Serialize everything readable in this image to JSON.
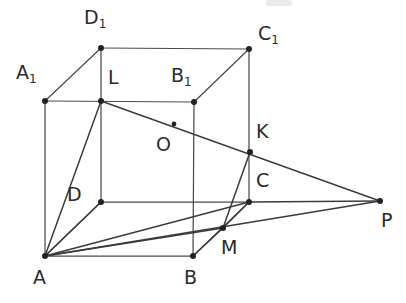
{
  "figure": {
    "width": 406,
    "height": 303,
    "background_color": "#ffffff",
    "line_color": "#3b3b3b",
    "vertex_color": "#222222",
    "label_color": "#2b2b2b"
  },
  "points": [
    {
      "id": "D1",
      "label": "D",
      "sub": "1",
      "x": 101,
      "y": 48,
      "label_x": 84,
      "label_y": 8,
      "dot": true
    },
    {
      "id": "C1",
      "label": "C",
      "sub": "1",
      "x": 249,
      "y": 49,
      "label_x": 258,
      "label_y": 24,
      "dot": true
    },
    {
      "id": "A1",
      "label": "A",
      "sub": "1",
      "x": 45,
      "y": 101,
      "label_x": 16,
      "label_y": 63,
      "dot": true
    },
    {
      "id": "B1",
      "label": "B",
      "sub": "1",
      "x": 194,
      "y": 102,
      "label_x": 171,
      "label_y": 66,
      "dot": true
    },
    {
      "id": "L",
      "label": "L",
      "sub": "",
      "x": 101,
      "y": 101,
      "label_x": 108,
      "label_y": 68,
      "dot": true
    },
    {
      "id": "O",
      "label": "O",
      "sub": "",
      "x": 174,
      "y": 124,
      "label_x": 156,
      "label_y": 135,
      "dot": true
    },
    {
      "id": "K",
      "label": "K",
      "sub": "",
      "x": 250,
      "y": 152,
      "label_x": 256,
      "label_y": 122,
      "dot": true
    },
    {
      "id": "D",
      "label": "D",
      "sub": "",
      "x": 101,
      "y": 202,
      "label_x": 67,
      "label_y": 185,
      "dot": true
    },
    {
      "id": "C",
      "label": "C",
      "sub": "",
      "x": 249,
      "y": 202,
      "label_x": 256,
      "label_y": 171,
      "dot": true
    },
    {
      "id": "P",
      "label": "P",
      "sub": "",
      "x": 380,
      "y": 201,
      "label_x": 381,
      "label_y": 211,
      "dot": true
    },
    {
      "id": "M",
      "label": "M",
      "sub": "",
      "x": 223,
      "y": 228,
      "label_x": 221,
      "label_y": 238,
      "dot": true
    },
    {
      "id": "A",
      "label": "A",
      "sub": "",
      "x": 45,
      "y": 256,
      "label_x": 33,
      "label_y": 268,
      "dot": true
    },
    {
      "id": "B",
      "label": "B",
      "sub": "",
      "x": 193,
      "y": 256,
      "label_x": 184,
      "label_y": 268,
      "dot": true
    }
  ],
  "segments": [
    {
      "name": "edge-D1-C1",
      "from": "D1",
      "to": "C1",
      "style": "thin"
    },
    {
      "name": "edge-D1-A1",
      "from": "D1",
      "to": "A1",
      "style": "thin"
    },
    {
      "name": "edge-D1-D",
      "from": "D1",
      "to": "D",
      "style": "thin"
    },
    {
      "name": "edge-C1-B1",
      "from": "C1",
      "to": "B1",
      "style": "thin"
    },
    {
      "name": "edge-C1-C",
      "from": "C1",
      "to": "C",
      "style": "thin"
    },
    {
      "name": "edge-A1-B1",
      "from": "A1",
      "to": "B1",
      "style": "thin"
    },
    {
      "name": "edge-A1-A",
      "from": "A1",
      "to": "A",
      "style": "thin"
    },
    {
      "name": "edge-B1-B",
      "from": "B1",
      "to": "B",
      "style": "thin"
    },
    {
      "name": "edge-D-C",
      "from": "D",
      "to": "C",
      "style": "thin"
    },
    {
      "name": "edge-D-A",
      "from": "D",
      "to": "A",
      "style": "thin"
    },
    {
      "name": "edge-A-B",
      "from": "A",
      "to": "B",
      "style": "thin"
    },
    {
      "name": "edge-B-C",
      "from": "B",
      "to": "C",
      "style": "thin"
    },
    {
      "name": "line-L-P",
      "from": "L",
      "to": "P",
      "style": "thick"
    },
    {
      "name": "line-A-P",
      "from": "A",
      "to": "P",
      "style": "thick"
    },
    {
      "name": "line-A-L",
      "from": "A",
      "to": "L",
      "style": "thick"
    },
    {
      "name": "line-A-D",
      "from": "A",
      "to": "D",
      "style": "thick"
    },
    {
      "name": "line-A-M",
      "from": "A",
      "to": "M",
      "style": "thick"
    },
    {
      "name": "line-A-C",
      "from": "A",
      "to": "C",
      "style": "thick"
    },
    {
      "name": "line-K-M",
      "from": "K",
      "to": "M",
      "style": "thick"
    },
    {
      "name": "line-C-M",
      "from": "C",
      "to": "M",
      "style": "thick"
    },
    {
      "name": "line-M-B",
      "from": "M",
      "to": "B",
      "style": "thick"
    },
    {
      "name": "line-C-P",
      "from": "C",
      "to": "P",
      "style": "thick"
    }
  ],
  "artifacts": [
    {
      "name": "scan-smudge",
      "x": 266,
      "y": 0,
      "w": 26,
      "h": 6
    }
  ]
}
